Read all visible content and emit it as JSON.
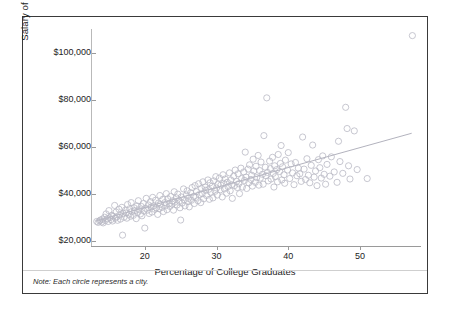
{
  "figure": {
    "note": "Note: Each circle represents a city.",
    "border_color": "#3a3a3a",
    "background": "#ffffff"
  },
  "chart_data": {
    "type": "scatter",
    "title": "",
    "xlabel": "Percentage of College Graduates",
    "ylabel": "Salary of High School Graduates",
    "xlim": [
      12.5,
      58.5
    ],
    "ylim": [
      18000,
      110000
    ],
    "xticks": [
      20,
      30,
      40,
      50
    ],
    "xticklabels": [
      "20",
      "30",
      "40",
      "50"
    ],
    "yticks": [
      20000,
      40000,
      60000,
      80000,
      100000
    ],
    "yticklabels": [
      "$20,000",
      "$40,000",
      "$60,000",
      "$80,000",
      "$100,000"
    ],
    "grid": false,
    "legend": null,
    "marker": {
      "shape": "circle",
      "filled": false,
      "color": "#b9b9c4",
      "size": 3.1
    },
    "trendline": {
      "type": "linear",
      "color": "#a9a9b5",
      "x_start": 13.2,
      "y_start": 28600,
      "x_end": 57.2,
      "y_end": 65800
    },
    "annotations": [
      "Note: Each circle represents a city."
    ],
    "points": [
      [
        13.3,
        28400
      ],
      [
        13.5,
        28000
      ],
      [
        13.7,
        28600
      ],
      [
        13.8,
        29000
      ],
      [
        14.0,
        28200
      ],
      [
        14.1,
        29400
      ],
      [
        14.2,
        27800
      ],
      [
        14.4,
        30200
      ],
      [
        14.5,
        28800
      ],
      [
        14.6,
        31600
      ],
      [
        14.8,
        29600
      ],
      [
        14.9,
        28400
      ],
      [
        15.0,
        33000
      ],
      [
        15.1,
        30000
      ],
      [
        15.3,
        29200
      ],
      [
        15.4,
        31000
      ],
      [
        15.5,
        28600
      ],
      [
        15.6,
        30600
      ],
      [
        15.8,
        35200
      ],
      [
        15.9,
        29800
      ],
      [
        16.0,
        32400
      ],
      [
        16.1,
        30400
      ],
      [
        16.2,
        28900
      ],
      [
        16.4,
        33600
      ],
      [
        16.5,
        31200
      ],
      [
        16.6,
        29400
      ],
      [
        16.8,
        34400
      ],
      [
        16.9,
        22600
      ],
      [
        17.0,
        31800
      ],
      [
        17.1,
        30200
      ],
      [
        17.3,
        33200
      ],
      [
        17.4,
        32000
      ],
      [
        17.5,
        29800
      ],
      [
        17.6,
        35600
      ],
      [
        17.8,
        31400
      ],
      [
        17.9,
        33800
      ],
      [
        18.0,
        30600
      ],
      [
        18.1,
        36400
      ],
      [
        18.2,
        32600
      ],
      [
        18.4,
        31000
      ],
      [
        18.5,
        34200
      ],
      [
        18.6,
        33000
      ],
      [
        18.8,
        29600
      ],
      [
        18.9,
        35000
      ],
      [
        19.0,
        32200
      ],
      [
        19.1,
        37200
      ],
      [
        19.2,
        33400
      ],
      [
        19.4,
        31600
      ],
      [
        19.5,
        34800
      ],
      [
        19.6,
        30800
      ],
      [
        19.8,
        36000
      ],
      [
        19.9,
        32800
      ],
      [
        20.0,
        25600
      ],
      [
        20.1,
        34000
      ],
      [
        20.2,
        38200
      ],
      [
        20.4,
        33200
      ],
      [
        20.5,
        35400
      ],
      [
        20.6,
        31800
      ],
      [
        20.8,
        36800
      ],
      [
        20.9,
        34600
      ],
      [
        21.0,
        32400
      ],
      [
        21.1,
        38600
      ],
      [
        21.2,
        35000
      ],
      [
        21.4,
        33600
      ],
      [
        21.5,
        37400
      ],
      [
        21.6,
        34200
      ],
      [
        21.8,
        31400
      ],
      [
        21.9,
        36200
      ],
      [
        22.0,
        33800
      ],
      [
        22.1,
        39400
      ],
      [
        22.2,
        35600
      ],
      [
        22.4,
        34400
      ],
      [
        22.5,
        37800
      ],
      [
        22.6,
        32600
      ],
      [
        22.8,
        36400
      ],
      [
        22.9,
        35200
      ],
      [
        23.0,
        40200
      ],
      [
        23.1,
        33400
      ],
      [
        23.2,
        38000
      ],
      [
        23.4,
        36000
      ],
      [
        23.5,
        34800
      ],
      [
        23.6,
        39000
      ],
      [
        23.8,
        35800
      ],
      [
        23.9,
        37200
      ],
      [
        24.0,
        33200
      ],
      [
        24.1,
        41000
      ],
      [
        24.2,
        36600
      ],
      [
        24.4,
        38400
      ],
      [
        24.5,
        35400
      ],
      [
        24.6,
        40000
      ],
      [
        24.8,
        37000
      ],
      [
        24.9,
        34200
      ],
      [
        25.0,
        29000
      ],
      [
        25.1,
        38800
      ],
      [
        25.2,
        36200
      ],
      [
        25.4,
        42200
      ],
      [
        25.5,
        37600
      ],
      [
        25.6,
        35000
      ],
      [
        25.8,
        39600
      ],
      [
        25.9,
        41400
      ],
      [
        26.0,
        36800
      ],
      [
        26.1,
        38200
      ],
      [
        26.2,
        34600
      ],
      [
        26.4,
        40600
      ],
      [
        26.5,
        37400
      ],
      [
        26.6,
        42800
      ],
      [
        26.8,
        39000
      ],
      [
        26.9,
        36000
      ],
      [
        27.0,
        43600
      ],
      [
        27.1,
        38600
      ],
      [
        27.2,
        41000
      ],
      [
        27.4,
        37200
      ],
      [
        27.5,
        44400
      ],
      [
        27.6,
        39800
      ],
      [
        27.8,
        36400
      ],
      [
        27.9,
        42400
      ],
      [
        28.0,
        40200
      ],
      [
        28.1,
        45200
      ],
      [
        28.2,
        38000
      ],
      [
        28.4,
        43000
      ],
      [
        28.5,
        41600
      ],
      [
        28.6,
        39400
      ],
      [
        28.8,
        46000
      ],
      [
        28.9,
        42000
      ],
      [
        29.0,
        37800
      ],
      [
        29.1,
        44800
      ],
      [
        29.2,
        40800
      ],
      [
        29.4,
        43400
      ],
      [
        29.5,
        38400
      ],
      [
        29.6,
        45600
      ],
      [
        29.8,
        41200
      ],
      [
        29.9,
        47400
      ],
      [
        30.0,
        42600
      ],
      [
        30.1,
        39600
      ],
      [
        30.2,
        44200
      ],
      [
        30.4,
        46800
      ],
      [
        30.5,
        41800
      ],
      [
        30.6,
        43800
      ],
      [
        30.8,
        38800
      ],
      [
        30.9,
        48200
      ],
      [
        31.0,
        44600
      ],
      [
        31.1,
        42200
      ],
      [
        31.2,
        46400
      ],
      [
        31.4,
        40400
      ],
      [
        31.5,
        45000
      ],
      [
        31.6,
        43200
      ],
      [
        31.8,
        49000
      ],
      [
        31.9,
        41400
      ],
      [
        32.0,
        46000
      ],
      [
        32.1,
        44000
      ],
      [
        32.2,
        38200
      ],
      [
        32.4,
        47600
      ],
      [
        32.5,
        43600
      ],
      [
        32.6,
        50200
      ],
      [
        32.8,
        45400
      ],
      [
        32.9,
        42800
      ],
      [
        33.0,
        48600
      ],
      [
        33.1,
        44400
      ],
      [
        33.2,
        40200
      ],
      [
        33.4,
        51000
      ],
      [
        33.5,
        46600
      ],
      [
        33.6,
        43000
      ],
      [
        33.8,
        49400
      ],
      [
        33.9,
        45800
      ],
      [
        34.0,
        57800
      ],
      [
        34.1,
        47200
      ],
      [
        34.2,
        42400
      ],
      [
        34.4,
        50600
      ],
      [
        34.5,
        44800
      ],
      [
        34.6,
        52400
      ],
      [
        34.8,
        46200
      ],
      [
        34.9,
        48000
      ],
      [
        35.0,
        43400
      ],
      [
        35.1,
        54800
      ],
      [
        35.2,
        49800
      ],
      [
        35.4,
        45000
      ],
      [
        35.5,
        51800
      ],
      [
        35.6,
        47000
      ],
      [
        35.8,
        56400
      ],
      [
        35.9,
        43800
      ],
      [
        36.0,
        50000
      ],
      [
        36.1,
        46800
      ],
      [
        36.2,
        53600
      ],
      [
        36.4,
        48400
      ],
      [
        36.5,
        44200
      ],
      [
        36.6,
        64800
      ],
      [
        36.8,
        51400
      ],
      [
        36.9,
        47800
      ],
      [
        37.0,
        80800
      ],
      [
        37.1,
        49200
      ],
      [
        37.2,
        45600
      ],
      [
        37.4,
        54000
      ],
      [
        37.5,
        50800
      ],
      [
        37.6,
        46400
      ],
      [
        37.8,
        55600
      ],
      [
        37.9,
        48800
      ],
      [
        38.0,
        43000
      ],
      [
        38.1,
        52000
      ],
      [
        38.2,
        47400
      ],
      [
        38.4,
        50400
      ],
      [
        38.5,
        45200
      ],
      [
        38.6,
        56800
      ],
      [
        38.8,
        49600
      ],
      [
        38.9,
        53000
      ],
      [
        39.0,
        60600
      ],
      [
        39.1,
        46000
      ],
      [
        39.2,
        51600
      ],
      [
        39.4,
        48200
      ],
      [
        39.5,
        44600
      ],
      [
        39.6,
        54400
      ],
      [
        39.9,
        50200
      ],
      [
        40.0,
        57600
      ],
      [
        40.2,
        46600
      ],
      [
        40.4,
        52800
      ],
      [
        40.6,
        49000
      ],
      [
        40.8,
        44000
      ],
      [
        41.0,
        53400
      ],
      [
        41.2,
        47800
      ],
      [
        41.4,
        51000
      ],
      [
        41.6,
        48600
      ],
      [
        41.8,
        45400
      ],
      [
        42.0,
        64200
      ],
      [
        42.2,
        50600
      ],
      [
        42.4,
        46200
      ],
      [
        42.6,
        55000
      ],
      [
        42.8,
        48000
      ],
      [
        43.0,
        44800
      ],
      [
        43.2,
        52200
      ],
      [
        43.4,
        60800
      ],
      [
        43.6,
        47200
      ],
      [
        43.8,
        49800
      ],
      [
        44.0,
        43600
      ],
      [
        44.2,
        54600
      ],
      [
        44.4,
        51200
      ],
      [
        44.6,
        46800
      ],
      [
        44.8,
        56200
      ],
      [
        45.0,
        48400
      ],
      [
        45.2,
        44200
      ],
      [
        45.4,
        52600
      ],
      [
        45.8,
        47600
      ],
      [
        46.0,
        55800
      ],
      [
        46.4,
        49400
      ],
      [
        46.8,
        45000
      ],
      [
        47.0,
        62400
      ],
      [
        47.2,
        53800
      ],
      [
        47.6,
        48800
      ],
      [
        48.0,
        76800
      ],
      [
        48.2,
        67800
      ],
      [
        48.4,
        52000
      ],
      [
        48.6,
        46400
      ],
      [
        49.2,
        66800
      ],
      [
        49.6,
        50400
      ],
      [
        51.0,
        46600
      ],
      [
        57.3,
        107200
      ]
    ]
  }
}
